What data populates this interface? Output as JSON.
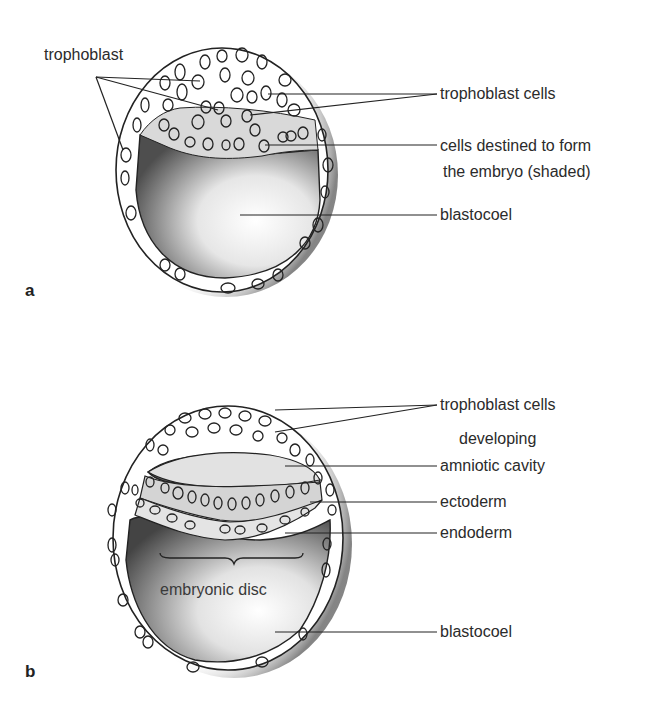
{
  "figure": {
    "panels": [
      {
        "id": "a",
        "letter": "a",
        "labels": {
          "trophoblast": "trophoblast",
          "trophoblast_cells": "trophoblast cells",
          "embryo_cells_line1": "cells destined to form",
          "embryo_cells_line2": "the embryo (shaded)",
          "blastocoel": "blastocoel"
        }
      },
      {
        "id": "b",
        "letter": "b",
        "labels": {
          "trophoblast_cells": "trophoblast cells",
          "amniotic_line1": "developing",
          "amniotic_line2": "amniotic cavity",
          "ectoderm": "ectoderm",
          "endoderm": "endoderm",
          "embryonic_disc": "embryonic disc",
          "blastocoel": "blastocoel"
        }
      }
    ],
    "colors": {
      "outline": "#222222",
      "shading_dark": "#5a5a5a",
      "shading_light": "#e8e8e8",
      "background": "#ffffff"
    }
  }
}
